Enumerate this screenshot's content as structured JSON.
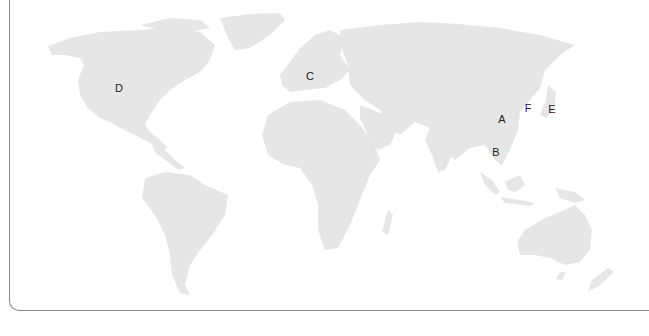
{
  "map": {
    "type": "world-map",
    "land_color": "#e6e6e6",
    "label_color": "#222222",
    "border_color": "#8a8a8a",
    "markers": [
      {
        "id": "A",
        "label": "A",
        "x": 502,
        "y": 119,
        "region": "Central China"
      },
      {
        "id": "B",
        "label": "B",
        "x": 496,
        "y": 152,
        "region": "Indochina"
      },
      {
        "id": "C",
        "label": "C",
        "x": 310,
        "y": 76,
        "region": "Central Europe"
      },
      {
        "id": "D",
        "label": "D",
        "x": 119,
        "y": 88,
        "region": "Central United States"
      },
      {
        "id": "E",
        "label": "E",
        "x": 552,
        "y": 109,
        "region": "Japan"
      },
      {
        "id": "F",
        "label": "F",
        "x": 528,
        "y": 108,
        "region": "Korea / Yellow Sea"
      }
    ]
  }
}
